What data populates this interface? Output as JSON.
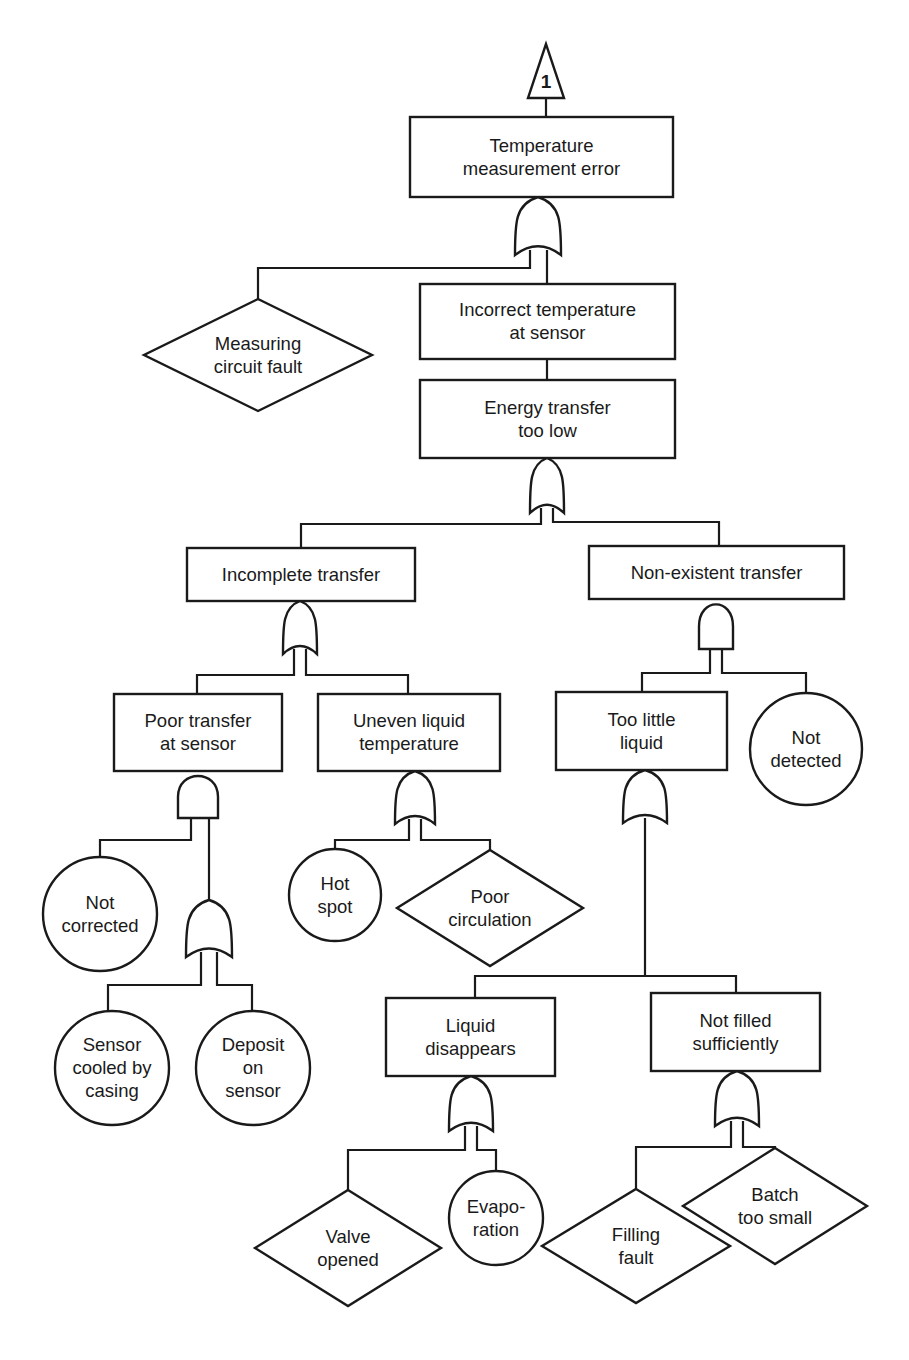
{
  "diagram": {
    "type": "fault-tree",
    "transfer": {
      "label": "1",
      "x": 546,
      "y_top": 44,
      "y_bot": 98,
      "half_w": 18
    },
    "nodes": [
      {
        "id": "temp-measurement-error",
        "shape": "rect",
        "lines": [
          "Temperature",
          "measurement error"
        ],
        "x": 410,
        "y": 117,
        "w": 263,
        "h": 80
      },
      {
        "id": "measuring-circuit-fault",
        "shape": "diamond",
        "lines": [
          "Measuring",
          "circuit fault"
        ],
        "cx": 258,
        "cy": 355,
        "hw": 114,
        "hh": 56
      },
      {
        "id": "incorrect-temp-at-sensor",
        "shape": "rect",
        "lines": [
          "Incorrect temperature",
          "at sensor"
        ],
        "x": 420,
        "y": 284,
        "w": 255,
        "h": 75
      },
      {
        "id": "energy-transfer-too-low",
        "shape": "rect",
        "lines": [
          "Energy transfer",
          "too low"
        ],
        "x": 420,
        "y": 380,
        "w": 255,
        "h": 78
      },
      {
        "id": "incomplete-transfer",
        "shape": "rect",
        "lines": [
          "Incomplete transfer"
        ],
        "x": 187,
        "y": 548,
        "w": 228,
        "h": 53
      },
      {
        "id": "non-existent-transfer",
        "shape": "rect",
        "lines": [
          "Non-existent transfer"
        ],
        "x": 589,
        "y": 546,
        "w": 255,
        "h": 53
      },
      {
        "id": "poor-transfer-at-sensor",
        "shape": "rect",
        "lines": [
          "Poor transfer",
          "at sensor"
        ],
        "x": 114,
        "y": 694,
        "w": 168,
        "h": 77
      },
      {
        "id": "uneven-liquid-temp",
        "shape": "rect",
        "lines": [
          "Uneven liquid",
          "temperature"
        ],
        "x": 318,
        "y": 694,
        "w": 182,
        "h": 77
      },
      {
        "id": "too-little-liquid",
        "shape": "rect",
        "lines": [
          "Too little",
          "liquid"
        ],
        "x": 556,
        "y": 692,
        "w": 171,
        "h": 78
      },
      {
        "id": "not-detected",
        "shape": "circle",
        "lines": [
          "Not",
          "detected"
        ],
        "cx": 806,
        "cy": 749,
        "r": 56
      },
      {
        "id": "not-corrected",
        "shape": "circle",
        "lines": [
          "Not",
          "corrected"
        ],
        "cx": 100,
        "cy": 914,
        "r": 57
      },
      {
        "id": "hot-spot",
        "shape": "circle",
        "lines": [
          "Hot",
          "spot"
        ],
        "cx": 335,
        "cy": 895,
        "r": 46
      },
      {
        "id": "poor-circulation",
        "shape": "diamond",
        "lines": [
          "Poor",
          "circulation"
        ],
        "cx": 490,
        "cy": 908,
        "hw": 93,
        "hh": 58
      },
      {
        "id": "sensor-cooled-by-casing",
        "shape": "circle",
        "lines": [
          "Sensor",
          "cooled by",
          "casing"
        ],
        "cx": 112,
        "cy": 1068,
        "r": 57
      },
      {
        "id": "deposit-on-sensor",
        "shape": "circle",
        "lines": [
          "Deposit",
          "on",
          "sensor"
        ],
        "cx": 253,
        "cy": 1068,
        "r": 57
      },
      {
        "id": "liquid-disappears",
        "shape": "rect",
        "lines": [
          "Liquid",
          "disappears"
        ],
        "x": 386,
        "y": 998,
        "w": 169,
        "h": 78
      },
      {
        "id": "not-filled-sufficiently",
        "shape": "rect",
        "lines": [
          "Not filled",
          "sufficiently"
        ],
        "x": 651,
        "y": 993,
        "w": 169,
        "h": 78
      },
      {
        "id": "valve-opened",
        "shape": "diamond",
        "lines": [
          "Valve",
          "opened"
        ],
        "cx": 348,
        "cy": 1248,
        "hw": 93,
        "hh": 58
      },
      {
        "id": "evaporation",
        "shape": "circle",
        "lines": [
          "Evapo-",
          "ration"
        ],
        "cx": 496,
        "cy": 1218,
        "r": 47
      },
      {
        "id": "filling-fault",
        "shape": "diamond",
        "lines": [
          "Filling",
          "fault"
        ],
        "cx": 636,
        "cy": 1246,
        "hw": 94,
        "hh": 57
      },
      {
        "id": "batch-too-small",
        "shape": "diamond",
        "lines": [
          "Batch",
          "too small"
        ],
        "cx": 775,
        "cy": 1206,
        "hw": 92,
        "hh": 58
      }
    ],
    "gates": [
      {
        "id": "gate-top",
        "type": "OR",
        "cx": 538,
        "top": 197,
        "w": 46,
        "h": 58
      },
      {
        "id": "gate-energy",
        "type": "OR",
        "cx": 547,
        "top": 458,
        "w": 34,
        "h": 55
      },
      {
        "id": "gate-incomplete",
        "type": "OR",
        "cx": 300,
        "top": 601,
        "w": 34,
        "h": 53
      },
      {
        "id": "gate-nonexistent",
        "type": "AND",
        "cx": 716,
        "top": 599,
        "w": 34,
        "h": 50
      },
      {
        "id": "gate-poor-transfer",
        "type": "AND",
        "cx": 198,
        "top": 771,
        "w": 40,
        "h": 47
      },
      {
        "id": "gate-uneven",
        "type": "OR",
        "cx": 415,
        "top": 771,
        "w": 40,
        "h": 53
      },
      {
        "id": "gate-too-little",
        "type": "OR",
        "cx": 645,
        "top": 770,
        "w": 44,
        "h": 53
      },
      {
        "id": "gate-sensor-causes",
        "type": "OR",
        "cx": 209,
        "top": 900,
        "w": 46,
        "h": 57
      },
      {
        "id": "gate-liquid-disappears",
        "type": "OR",
        "cx": 471,
        "top": 1076,
        "w": 44,
        "h": 55
      },
      {
        "id": "gate-not-filled",
        "type": "OR",
        "cx": 737,
        "top": 1071,
        "w": 44,
        "h": 55
      }
    ],
    "edges": [
      [
        [
          546,
          98
        ],
        [
          546,
          117
        ]
      ],
      [
        [
          530,
          250
        ],
        [
          530,
          268
        ],
        [
          258,
          268
        ],
        [
          258,
          299
        ]
      ],
      [
        [
          547,
          250
        ],
        [
          547,
          284
        ]
      ],
      [
        [
          547,
          359
        ],
        [
          547,
          380
        ]
      ],
      [
        [
          541,
          508
        ],
        [
          541,
          524
        ],
        [
          301,
          524
        ],
        [
          301,
          548
        ]
      ],
      [
        [
          553,
          508
        ],
        [
          553,
          522
        ],
        [
          719,
          522
        ],
        [
          719,
          546
        ]
      ],
      [
        [
          294,
          649
        ],
        [
          294,
          675
        ],
        [
          197,
          675
        ],
        [
          197,
          694
        ]
      ],
      [
        [
          306,
          649
        ],
        [
          306,
          675
        ],
        [
          408,
          675
        ],
        [
          408,
          694
        ]
      ],
      [
        [
          710,
          649
        ],
        [
          710,
          673
        ],
        [
          642,
          673
        ],
        [
          642,
          692
        ]
      ],
      [
        [
          722,
          649
        ],
        [
          722,
          673
        ],
        [
          806,
          673
        ],
        [
          806,
          693
        ]
      ],
      [
        [
          191,
          818
        ],
        [
          191,
          840
        ],
        [
          100,
          840
        ],
        [
          100,
          857
        ]
      ],
      [
        [
          209,
          818
        ],
        [
          209,
          900
        ]
      ],
      [
        [
          409,
          819
        ],
        [
          409,
          840
        ],
        [
          335,
          840
        ],
        [
          335,
          849
        ]
      ],
      [
        [
          421,
          819
        ],
        [
          421,
          840
        ],
        [
          490,
          840
        ],
        [
          490,
          850
        ]
      ],
      [
        [
          201,
          952
        ],
        [
          201,
          985
        ],
        [
          108,
          985
        ],
        [
          108,
          1011
        ]
      ],
      [
        [
          217,
          952
        ],
        [
          217,
          985
        ],
        [
          252,
          985
        ],
        [
          252,
          1011
        ]
      ],
      [
        [
          645,
          818
        ],
        [
          645,
          976
        ],
        [
          475,
          976
        ],
        [
          475,
          998
        ]
      ],
      [
        [
          645,
          976
        ],
        [
          736,
          976
        ],
        [
          736,
          993
        ]
      ],
      [
        [
          465,
          1126
        ],
        [
          465,
          1150
        ],
        [
          348,
          1150
        ],
        [
          348,
          1190
        ]
      ],
      [
        [
          477,
          1126
        ],
        [
          477,
          1150
        ],
        [
          496,
          1150
        ],
        [
          496,
          1171
        ]
      ],
      [
        [
          731,
          1121
        ],
        [
          731,
          1147
        ],
        [
          636,
          1147
        ],
        [
          636,
          1189
        ]
      ],
      [
        [
          743,
          1121
        ],
        [
          743,
          1147
        ],
        [
          775,
          1147
        ],
        [
          775,
          1148
        ]
      ]
    ]
  }
}
